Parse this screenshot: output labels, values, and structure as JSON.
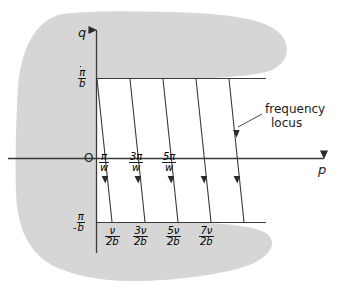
{
  "figure": {
    "type": "schematic-diagram",
    "title_visible": false,
    "background_color": "#ffffff",
    "region_fill_color": "#d6d6d6",
    "line_color": "#3a3a3a",
    "text_color": "#1b1b1b",
    "axes": {
      "vertical": {
        "name": "axis-q",
        "label": "q",
        "arrow": "up"
      },
      "horizontal": {
        "name": "axis-p",
        "label": "p",
        "arrow": "right"
      },
      "origin_label": "O"
    },
    "y_ticks": [
      {
        "name": "y-tick-pi-over-b",
        "numerator": "π",
        "denominator": "b",
        "sign": "",
        "position": "top"
      },
      {
        "name": "y-tick-neg-pi-over-b",
        "numerator": "π",
        "denominator": "b",
        "sign": "-",
        "position": "bottom"
      }
    ],
    "x_ticks_upper": [
      {
        "name": "x-tick-pi-over-w",
        "numerator": "π",
        "denominator": "w"
      },
      {
        "name": "x-tick-3pi-over-w",
        "numerator": "3π",
        "denominator": "w"
      },
      {
        "name": "x-tick-5pi-over-w",
        "numerator": "5π",
        "denominator": "w"
      }
    ],
    "x_ticks_lower": [
      {
        "name": "x-tick-nu-over-2b",
        "numerator": "ν",
        "denominator": "2b"
      },
      {
        "name": "x-tick-3nu-over-2b",
        "numerator": "3ν",
        "denominator": "2b"
      },
      {
        "name": "x-tick-5nu-over-2b",
        "numerator": "5ν",
        "denominator": "2b"
      },
      {
        "name": "x-tick-7nu-over-2b",
        "numerator": "7ν",
        "denominator": "2b"
      }
    ],
    "annotation": {
      "name": "frequency-locus-callout",
      "line1": "frequency",
      "line2": "locus"
    },
    "locus_lines": {
      "count": 5,
      "direction": "downward",
      "arrowheads_per_line": 1,
      "top_y_value": "π/b",
      "bottom_y_value": "-π/b"
    }
  }
}
